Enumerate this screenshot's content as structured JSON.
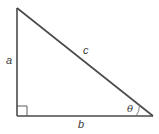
{
  "diagram": {
    "labels": {
      "side_vertical": "a",
      "hypotenuse": "c",
      "side_base": "b",
      "angle": "θ"
    },
    "colors": {
      "stroke": "#4a4a4a",
      "text": "#3a3a3a",
      "background": "#ffffff"
    }
  }
}
